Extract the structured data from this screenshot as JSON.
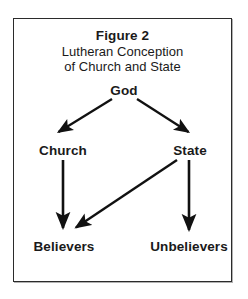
{
  "figure": {
    "title_line_1": "Figure 2",
    "title_line_2": "Lutheran Conception",
    "title_line_3": "of Church and State",
    "border_color": "#2b2b2b",
    "background_color": "#ffffff",
    "ink_color": "#111111"
  },
  "nodes": [
    {
      "id": "god",
      "label": "God",
      "x": 124,
      "y": 90
    },
    {
      "id": "church",
      "label": "Church",
      "x": 63,
      "y": 150
    },
    {
      "id": "state",
      "label": "State",
      "x": 190,
      "y": 150
    },
    {
      "id": "believers",
      "label": "Believers",
      "x": 64,
      "y": 246
    },
    {
      "id": "unbelievers",
      "label": "Unbelievers",
      "x": 189,
      "y": 246
    }
  ],
  "edges": [
    {
      "id": "god-to-church",
      "from": "god",
      "to": "church",
      "x1": 112,
      "y1": 99,
      "x2": 57,
      "y2": 133,
      "style": "arrow"
    },
    {
      "id": "god-to-state",
      "from": "god",
      "to": "state",
      "x1": 137,
      "y1": 99,
      "x2": 190,
      "y2": 133,
      "style": "arrow"
    },
    {
      "id": "church-to-believers",
      "from": "church",
      "to": "believers",
      "x1": 63,
      "y1": 160,
      "x2": 63,
      "y2": 230,
      "style": "arrow"
    },
    {
      "id": "state-to-unbelievers",
      "from": "state",
      "to": "unbelievers",
      "x1": 189,
      "y1": 160,
      "x2": 189,
      "y2": 232,
      "style": "arrow"
    },
    {
      "id": "state-to-believers",
      "from": "state",
      "to": "believers",
      "x1": 177,
      "y1": 160,
      "x2": 74,
      "y2": 229,
      "style": "arrow"
    }
  ]
}
